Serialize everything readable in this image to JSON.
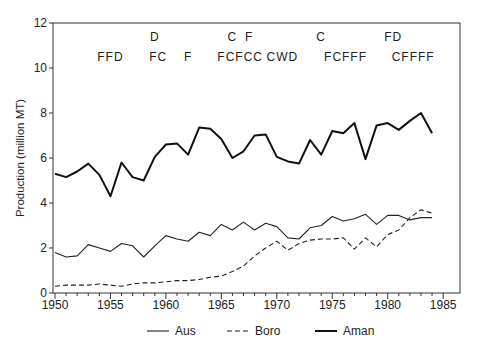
{
  "chart_data": {
    "type": "line",
    "title": "",
    "xlabel": "",
    "ylabel": "Production (million MT)",
    "xlim": [
      1950,
      1985
    ],
    "ylim": [
      0,
      12
    ],
    "x_ticks": [
      1950,
      1955,
      1960,
      1965,
      1970,
      1975,
      1980,
      1985
    ],
    "y_ticks": [
      0,
      2,
      4,
      6,
      8,
      10,
      12
    ],
    "grid": false,
    "legend_position": "bottom",
    "x": [
      1950,
      1951,
      1952,
      1953,
      1954,
      1955,
      1956,
      1957,
      1958,
      1959,
      1960,
      1961,
      1962,
      1963,
      1964,
      1965,
      1966,
      1967,
      1968,
      1969,
      1970,
      1971,
      1972,
      1973,
      1974,
      1975,
      1976,
      1977,
      1978,
      1979,
      1980,
      1981,
      1982,
      1983,
      1984
    ],
    "series": [
      {
        "name": "Aus",
        "style": "solid-thin",
        "values": [
          1.8,
          1.6,
          1.65,
          2.15,
          2.0,
          1.85,
          2.2,
          2.1,
          1.6,
          2.1,
          2.55,
          2.4,
          2.3,
          2.7,
          2.55,
          3.05,
          2.8,
          3.15,
          2.8,
          3.1,
          2.95,
          2.45,
          2.4,
          2.9,
          3.0,
          3.4,
          3.2,
          3.3,
          3.5,
          3.05,
          3.45,
          3.45,
          3.25,
          3.35,
          3.35
        ]
      },
      {
        "name": "Boro",
        "style": "dashed",
        "values": [
          0.3,
          0.35,
          0.35,
          0.35,
          0.4,
          0.35,
          0.3,
          0.4,
          0.45,
          0.45,
          0.5,
          0.55,
          0.55,
          0.6,
          0.7,
          0.75,
          0.95,
          1.2,
          1.65,
          2.0,
          2.3,
          1.9,
          2.2,
          2.35,
          2.4,
          2.4,
          2.45,
          1.95,
          2.45,
          2.05,
          2.6,
          2.8,
          3.35,
          3.7,
          3.55
        ]
      },
      {
        "name": "Aman",
        "style": "solid-thick",
        "values": [
          5.3,
          5.15,
          5.4,
          5.75,
          5.25,
          4.3,
          5.8,
          5.15,
          5.0,
          6.05,
          6.6,
          6.65,
          6.15,
          7.35,
          7.3,
          6.85,
          6.0,
          6.3,
          7.0,
          7.05,
          6.05,
          5.85,
          5.75,
          6.8,
          6.15,
          7.2,
          7.1,
          7.55,
          5.95,
          7.45,
          7.55,
          7.25,
          7.65,
          8.0,
          7.1
        ]
      }
    ],
    "annotations": {
      "row1": [
        {
          "text": "D",
          "year": 1959
        },
        {
          "text": "C",
          "year": 1966
        },
        {
          "text": "F",
          "year": 1967.5
        },
        {
          "text": "C",
          "year": 1974
        },
        {
          "text": "FD",
          "year": 1980.5
        }
      ],
      "row2": [
        {
          "text": "FFD",
          "year": 1955
        },
        {
          "text": "FC",
          "year": 1959.3
        },
        {
          "text": "F",
          "year": 1962
        },
        {
          "text": "FCFCC",
          "year": 1966.7
        },
        {
          "text": "CWD",
          "year": 1970.5
        },
        {
          "text": "FCFFF",
          "year": 1976.2
        },
        {
          "text": "CFFFF",
          "year": 1982.3
        }
      ]
    }
  },
  "legend": [
    {
      "label": "Aus",
      "style": "solid-thin"
    },
    {
      "label": "Boro",
      "style": "dashed"
    },
    {
      "label": "Aman",
      "style": "solid-thick"
    }
  ]
}
